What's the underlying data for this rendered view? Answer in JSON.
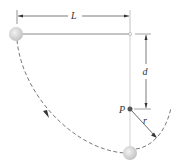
{
  "diagram": {
    "type": "physics-pendulum",
    "labels": {
      "length": "L",
      "distance": "d",
      "peg": "P",
      "radius": "r"
    },
    "colors": {
      "string": "#8a8a8a",
      "dimension": "#444444",
      "path": "#555555",
      "ball": "#d8d8d8",
      "peg": "#555555"
    }
  }
}
